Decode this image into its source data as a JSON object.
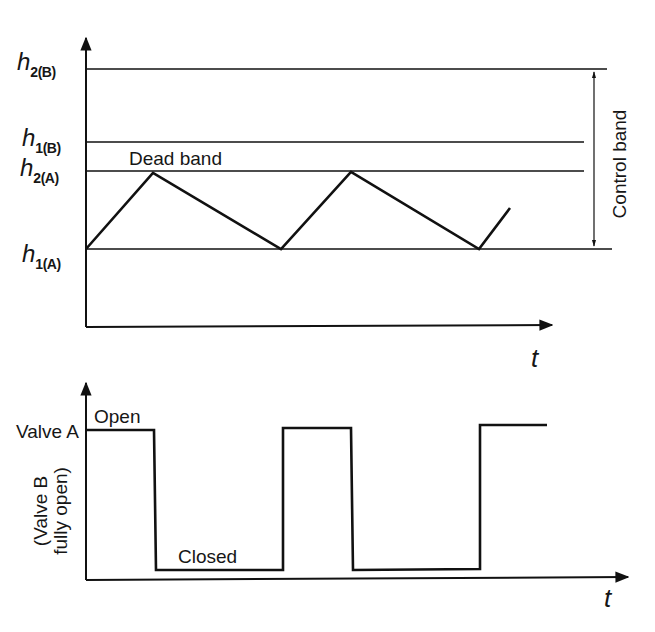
{
  "top_chart": {
    "levels": [
      {
        "id": "h2B",
        "symbol": "h",
        "subscript": "2(B)",
        "y": 69,
        "x_end": 607
      },
      {
        "id": "h1B",
        "symbol": "h",
        "subscript": "1(B)",
        "y": 142,
        "x_end": 584
      },
      {
        "id": "h2A",
        "symbol": "h",
        "subscript": "2(A)",
        "y": 171,
        "x_end": 584
      },
      {
        "id": "h1A",
        "symbol": "h",
        "subscript": "1(A)",
        "y": 249,
        "x_end": 612
      }
    ],
    "dead_band_label": "Dead band",
    "control_band_label": "Control band",
    "x_axis_label": "t",
    "level_waveform": [
      [
        86,
        249
      ],
      [
        153,
        173
      ],
      [
        281,
        249
      ],
      [
        351,
        172
      ],
      [
        479,
        249
      ],
      [
        510,
        208
      ]
    ]
  },
  "bottom_chart": {
    "valve_a_label": "Valve A",
    "open_label": "Open",
    "closed_label": "Closed",
    "valve_b_label_line1": "(Valve B",
    "valve_b_label_line2": "fully open)",
    "x_axis_label": "t",
    "valve_waveform": [
      [
        86,
        430
      ],
      [
        154,
        430
      ],
      [
        156,
        570
      ],
      [
        283,
        570
      ],
      [
        283,
        428
      ],
      [
        351,
        428
      ],
      [
        353,
        570
      ],
      [
        480,
        569
      ],
      [
        480,
        425
      ],
      [
        547,
        425
      ]
    ]
  },
  "chart_data": [
    {
      "type": "line",
      "title": "",
      "xlabel": "t",
      "ylabel": "Level h",
      "y_levels": [
        "h1(A)",
        "h2(A)",
        "h1(B)",
        "h2(B)"
      ],
      "annotations": [
        "Dead band (between h2(A) and h1(B))",
        "Control band (h1(A) to h2(B))"
      ],
      "series": [
        {
          "name": "level",
          "description": "sawtooth oscillating between h1(A) and h2(A)",
          "x": [
            0,
            1.6,
            4.4,
            5.9,
            8.7,
            9.4
          ],
          "y": [
            "h1(A)",
            "h2(A)",
            "h1(A)",
            "h2(A)",
            "h1(A)",
            "rising"
          ]
        }
      ],
      "grid": false
    },
    {
      "type": "line",
      "title": "",
      "xlabel": "t",
      "ylabel": "Valve A position (Valve B fully open)",
      "states": [
        "Open",
        "Closed"
      ],
      "series": [
        {
          "name": "Valve A",
          "description": "square wave: Open while level rising, Closed while falling",
          "x": [
            0,
            1.6,
            1.6,
            4.4,
            4.4,
            5.9,
            5.9,
            8.7,
            8.7,
            10.2
          ],
          "y": [
            "Open",
            "Open",
            "Closed",
            "Closed",
            "Open",
            "Open",
            "Closed",
            "Closed",
            "Open",
            "Open"
          ]
        }
      ],
      "grid": false
    }
  ]
}
